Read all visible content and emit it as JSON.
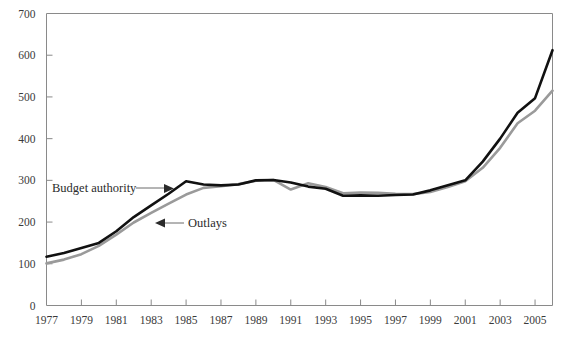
{
  "chart_data": {
    "type": "line",
    "title": "",
    "subtitle": "",
    "xlabel": "",
    "ylabel": "",
    "xlim": [
      1977,
      2006
    ],
    "ylim": [
      0,
      700
    ],
    "grid": false,
    "legend_position": "inline-annotations",
    "y_ticks": [
      0,
      100,
      200,
      300,
      400,
      500,
      600,
      700
    ],
    "y_tick_labels": [
      "0",
      "100",
      "200",
      "300",
      "400",
      "500",
      "600",
      "700"
    ],
    "x_ticks": [
      1977,
      1979,
      1981,
      1983,
      1985,
      1987,
      1989,
      1991,
      1993,
      1995,
      1997,
      1999,
      2001,
      2003,
      2005
    ],
    "x_tick_labels": [
      "1977",
      "1979",
      "1981",
      "1983",
      "1985",
      "1987",
      "1989",
      "1991",
      "1993",
      "1995",
      "1997",
      "1999",
      "2001",
      "2003",
      "2005"
    ],
    "x": [
      1977,
      1978,
      1979,
      1980,
      1981,
      1982,
      1983,
      1984,
      1985,
      1986,
      1987,
      1988,
      1989,
      1990,
      1991,
      1992,
      1993,
      1994,
      1995,
      1996,
      1997,
      1998,
      1999,
      2000,
      2001,
      2002,
      2003,
      2004,
      2005,
      2006
    ],
    "series": [
      {
        "name": "Budget authority",
        "color": "#111111",
        "width": 2.6,
        "values": [
          117,
          126,
          138,
          150,
          178,
          212,
          240,
          268,
          298,
          290,
          288,
          290,
          300,
          301,
          295,
          285,
          280,
          263,
          264,
          263,
          265,
          266,
          276,
          288,
          300,
          345,
          400,
          462,
          497,
          612
        ]
      },
      {
        "name": "Outlays",
        "color": "#9a9a9a",
        "width": 2.6,
        "values": [
          101,
          110,
          123,
          143,
          170,
          199,
          222,
          244,
          266,
          282,
          286,
          291,
          299,
          301,
          278,
          293,
          284,
          269,
          271,
          270,
          268,
          267,
          272,
          284,
          298,
          330,
          378,
          437,
          467,
          515
        ]
      }
    ],
    "annotations": [
      {
        "name": "budget-authority-annotation",
        "text": "Budget authority",
        "points_to": "budget-authority-line",
        "arrow_direction": "right"
      },
      {
        "name": "outlays-annotation",
        "text": "Outlays",
        "points_to": "outlays-line",
        "arrow_direction": "left"
      }
    ],
    "colors": {
      "budget_authority": "#111111",
      "outlays": "#9a9a9a",
      "axis": "#8a8a8a",
      "text": "#3a3a3a",
      "background": "#ffffff"
    }
  }
}
